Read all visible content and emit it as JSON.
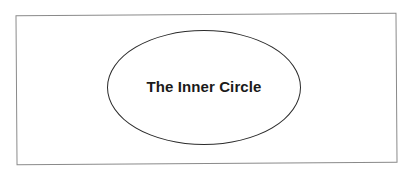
{
  "diagram": {
    "type": "single-node",
    "frame": {
      "shape": "rectangle",
      "border_color": "#8a8a8a"
    },
    "node": {
      "shape": "ellipse",
      "label": "The Inner Circle",
      "stroke_color": "#2b2b2b",
      "fill_color": "#ffffff",
      "text_color": "#1a1a1a"
    }
  }
}
